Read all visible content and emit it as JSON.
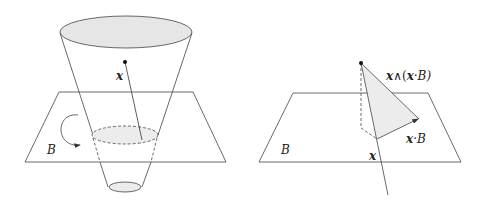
{
  "left_figure": {
    "point_label": "x",
    "plane_label": "B"
  },
  "right_figure": {
    "wedge_label_x": "x",
    "wedge_label_op": "∧(",
    "wedge_label_x2": "x",
    "wedge_label_rest": "·B)",
    "dot_label_x": "x",
    "dot_label_rest": "·B",
    "plane_label": "B",
    "projection_label": "x"
  },
  "colors": {
    "stroke": "#333333",
    "fill": "#e6e6e6"
  }
}
